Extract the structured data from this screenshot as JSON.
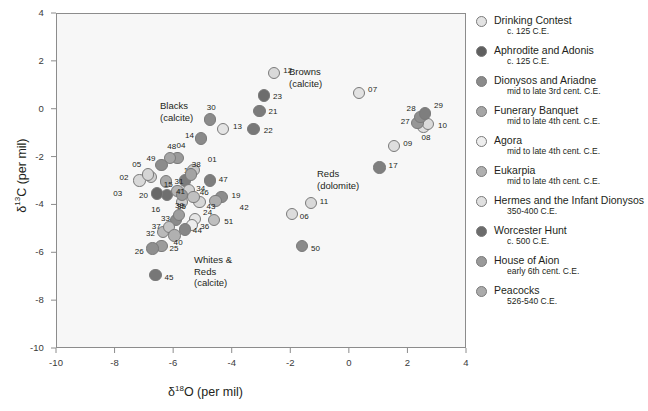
{
  "chart_data": {
    "type": "scatter",
    "title": "",
    "xlabel": "δ¹⁸O (per mil)",
    "ylabel": "δ¹³C (per mil)",
    "xlim": [
      -10,
      4
    ],
    "ylim": [
      -10,
      4
    ],
    "xticks": [
      "-10",
      "-8",
      "-6",
      "-4",
      "-2",
      "0",
      "2",
      "4"
    ],
    "yticks": [
      "4",
      "2",
      "0",
      "-2",
      "-4",
      "-6",
      "-8",
      "-10"
    ],
    "xtick_values": [
      -10,
      -8,
      -6,
      -4,
      -2,
      0,
      2,
      4
    ],
    "ytick_values": [
      4,
      2,
      0,
      -2,
      -4,
      -6,
      -8,
      -10
    ],
    "grid": false,
    "legend_position": "right",
    "groups": [
      {
        "name": "Blacks (calcite)",
        "label_lines": [
          "Blacks",
          "(calcite)"
        ],
        "material": "calcite"
      },
      {
        "name": "Browns (calcite)",
        "label_lines": [
          "Browns",
          "(calcite)"
        ],
        "material": "calcite"
      },
      {
        "name": "Reds (dolomite)",
        "label_lines": [
          "Reds",
          "(dolomite)"
        ],
        "material": "dolomite"
      },
      {
        "name": "Whites & Reds (calcite)",
        "label_lines": [
          "Whites &",
          "Reds",
          "(calcite)"
        ],
        "material": "calcite"
      }
    ],
    "points": [
      {
        "id": "01",
        "x": -5.3,
        "y": -2.55,
        "color": "#c9c9c9",
        "leader": true
      },
      {
        "id": "02",
        "x": -7.15,
        "y": -3.0,
        "color": "#d8d8d8"
      },
      {
        "id": "03",
        "x": -6.75,
        "y": -2.85,
        "color": "#cfcfcf",
        "leader": true
      },
      {
        "id": "04",
        "x": -5.85,
        "y": -2.05,
        "color": "#9a9a9a"
      },
      {
        "id": "05",
        "x": -6.85,
        "y": -2.75,
        "color": "#d5d5d5"
      },
      {
        "id": "06",
        "x": -1.95,
        "y": -4.4,
        "color": "#dcdcdc"
      },
      {
        "id": "07",
        "x": 0.35,
        "y": 0.65,
        "color": "#e2e2e2"
      },
      {
        "id": "08",
        "x": 2.55,
        "y": -0.75,
        "color": "#e0e0e0"
      },
      {
        "id": "09",
        "x": 1.55,
        "y": -1.55,
        "color": "#dedede"
      },
      {
        "id": "10",
        "x": 2.7,
        "y": -0.65,
        "color": "#dadada"
      },
      {
        "id": "11",
        "x": -1.3,
        "y": -3.95,
        "color": "#d9d9d9"
      },
      {
        "id": "12",
        "x": -2.55,
        "y": 1.5,
        "color": "#d9d9d9"
      },
      {
        "id": "13",
        "x": -4.3,
        "y": -0.85,
        "color": "#e4e4e4"
      },
      {
        "id": "14",
        "x": -5.05,
        "y": -1.25,
        "color": "#8a8a8a"
      },
      {
        "id": "15",
        "x": -6.25,
        "y": -3.05,
        "color": "#a9a9a9"
      },
      {
        "id": "16",
        "x": -6.2,
        "y": -3.6,
        "color": "#6f6f6f",
        "leader": true
      },
      {
        "id": "17",
        "x": 1.05,
        "y": -2.45,
        "color": "#7f7f7f"
      },
      {
        "id": "18",
        "x": -5.6,
        "y": -3.0,
        "color": "#7c7c7c"
      },
      {
        "id": "19",
        "x": -4.35,
        "y": -3.7,
        "color": "#8d8d8d"
      },
      {
        "id": "20",
        "x": -6.55,
        "y": -3.55,
        "color": "#686868"
      },
      {
        "id": "21",
        "x": -3.05,
        "y": -0.1,
        "color": "#7b7b7b"
      },
      {
        "id": "22",
        "x": -3.25,
        "y": -0.85,
        "color": "#787878"
      },
      {
        "id": "23",
        "x": -2.9,
        "y": 0.55,
        "color": "#6d6d6d"
      },
      {
        "id": "24",
        "x": -5.25,
        "y": -4.6,
        "color": "#e6e6e6"
      },
      {
        "id": "25",
        "x": -6.4,
        "y": -5.75,
        "color": "#9c9c9c"
      },
      {
        "id": "26",
        "x": -6.7,
        "y": -5.85,
        "color": "#8f8f8f"
      },
      {
        "id": "27",
        "x": 2.35,
        "y": -0.6,
        "color": "#969696"
      },
      {
        "id": "28",
        "x": 2.45,
        "y": -0.35,
        "color": "#8e8e8e"
      },
      {
        "id": "29",
        "x": 2.6,
        "y": -0.2,
        "color": "#7e7e7e"
      },
      {
        "id": "30",
        "x": -4.75,
        "y": -0.45,
        "color": "#8b8b8b"
      },
      {
        "id": "31",
        "x": -5.85,
        "y": -3.45,
        "color": "#b4b4b4"
      },
      {
        "id": "32",
        "x": -6.35,
        "y": -5.15,
        "color": "#b9b9b9"
      },
      {
        "id": "33",
        "x": -5.9,
        "y": -4.65,
        "color": "#8a8a8a"
      },
      {
        "id": "34",
        "x": -5.45,
        "y": -3.4,
        "color": "#d2d2d2"
      },
      {
        "id": "35",
        "x": -5.7,
        "y": -3.9,
        "color": "#cfcfcf"
      },
      {
        "id": "36",
        "x": -5.35,
        "y": -4.85,
        "color": "#ededed"
      },
      {
        "id": "37",
        "x": -6.15,
        "y": -4.95,
        "color": "#c4c4c4"
      },
      {
        "id": "38",
        "x": -5.4,
        "y": -2.75,
        "color": "#a3a3a3"
      },
      {
        "id": "39",
        "x": -5.8,
        "y": -4.45,
        "color": "#9e9e9e"
      },
      {
        "id": "40",
        "x": -5.95,
        "y": -5.3,
        "color": "#b0b0b0"
      },
      {
        "id": "41",
        "x": -5.7,
        "y": -3.6,
        "color": "#989898"
      },
      {
        "id": "42",
        "x": -4.55,
        "y": -3.85,
        "color": "#adadad",
        "leader": true
      },
      {
        "id": "43",
        "x": -5.1,
        "y": -3.9,
        "color": "#d6d6d6"
      },
      {
        "id": "44",
        "x": -5.6,
        "y": -5.05,
        "color": "#868686"
      },
      {
        "id": "45",
        "x": -6.6,
        "y": -6.95,
        "color": "#777777"
      },
      {
        "id": "46",
        "x": -5.3,
        "y": -3.7,
        "color": "#c0c0c0"
      },
      {
        "id": "47",
        "x": -4.75,
        "y": -3.0,
        "color": "#7d7d7d"
      },
      {
        "id": "48",
        "x": -6.1,
        "y": -2.05,
        "color": "#a5a5a5"
      },
      {
        "id": "49",
        "x": -6.4,
        "y": -2.35,
        "color": "#8c8c8c"
      },
      {
        "id": "50",
        "x": -1.6,
        "y": -5.75,
        "color": "#8a8a8a"
      },
      {
        "id": "51",
        "x": -4.6,
        "y": -4.65,
        "color": "#bfbfbf"
      }
    ]
  },
  "legend": {
    "entries": [
      {
        "label": "Drinking Contest",
        "date": "c. 125 C.E.",
        "color": "#e3e3e3"
      },
      {
        "label": "Aphrodite and Adonis",
        "date": "c. 125 C.E.",
        "color": "#5f5f5f"
      },
      {
        "label": "Dionysos and Ariadne",
        "date": "mid to late 3rd cent. C.E.",
        "color": "#8b8b8b"
      },
      {
        "label": "Funerary Banquet",
        "date": "mid to late 4th cent. C.E.",
        "color": "#a6a6a6"
      },
      {
        "label": "Agora",
        "date": "mid to late 4th cent. C.E.",
        "color": "#eeeeee"
      },
      {
        "label": "Eukarpia",
        "date": "mid to late 4th cent. C.E.",
        "color": "#b0b0b0"
      },
      {
        "label": "Hermes and the Infant Dionysos",
        "date": "350-400 C.E.",
        "color": "#e0e0e0"
      },
      {
        "label": "Worcester Hunt",
        "date": "c. 500 C.E.",
        "color": "#6c6c6c"
      },
      {
        "label": "House of Aion",
        "date": "early 6th cent. C.E.",
        "color": "#9a9a9a"
      },
      {
        "label": "Peacocks",
        "date": "526-540 C.E.",
        "color": "#ababab"
      }
    ]
  },
  "colors": {
    "plot_background": "#f7f7f7",
    "group_shade": "#e6e6e6",
    "axis": "#8c8c8c",
    "text": "#231f20"
  }
}
